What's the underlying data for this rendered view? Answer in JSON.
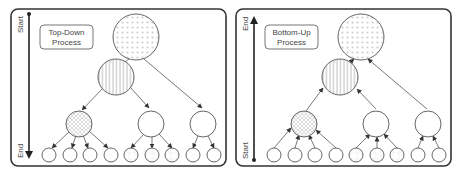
{
  "panels": [
    {
      "id": "top-down",
      "label_line1": "Top-Down",
      "label_line2": "Process",
      "axis_top": "Start",
      "axis_bottom": "End",
      "direction": "down"
    },
    {
      "id": "bottom-up",
      "label_line1": "Bottom-Up",
      "label_line2": "Process",
      "axis_top": "End",
      "axis_bottom": "Start",
      "direction": "up"
    }
  ],
  "tree": {
    "levels": 4,
    "root": "dotted pattern",
    "level2": [
      "striped pattern"
    ],
    "level3": [
      "cross-hatched",
      "plain",
      "plain"
    ],
    "leaves_per_level3_node": [
      4,
      3,
      2
    ]
  },
  "colors": {
    "stroke": "#555555",
    "pattern": "#c8c8c8",
    "panel_border": "#333333"
  }
}
